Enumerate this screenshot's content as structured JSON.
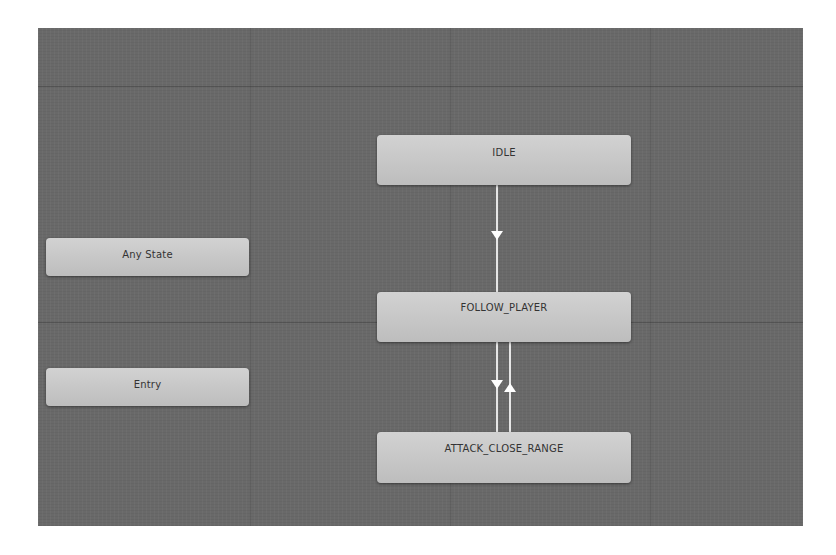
{
  "canvas": {
    "background": "#696969",
    "node_color": "#c8c8c8",
    "text_color": "#333333",
    "edge_color": "#e6e6e6"
  },
  "nodes": {
    "idle": {
      "label": "IDLE"
    },
    "follow_player": {
      "label": "FOLLOW_PLAYER"
    },
    "attack_close_range": {
      "label": "ATTACK_CLOSE_RANGE"
    },
    "any_state": {
      "label": "Any State"
    },
    "entry": {
      "label": "Entry"
    }
  },
  "transitions": [
    {
      "from": "IDLE",
      "to": "FOLLOW_PLAYER"
    },
    {
      "from": "FOLLOW_PLAYER",
      "to": "ATTACK_CLOSE_RANGE"
    },
    {
      "from": "ATTACK_CLOSE_RANGE",
      "to": "FOLLOW_PLAYER"
    }
  ]
}
